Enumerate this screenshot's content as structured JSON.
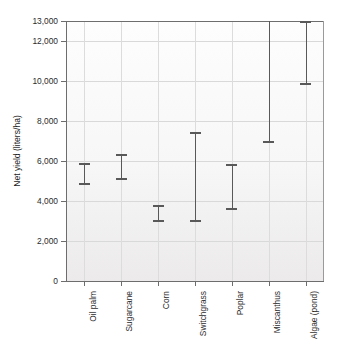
{
  "chart_data": {
    "type": "bar",
    "title": "",
    "subtitle": "",
    "xlabel": "",
    "ylabel": "Net yield (liters/ha)",
    "categories": [
      "Oil palm",
      "Sugarcane",
      "Corn",
      "Switchgrass",
      "Poplar",
      "Miscanthus",
      "Algae (pond)"
    ],
    "series": [
      {
        "name": "Net yield range",
        "low": [
          4900,
          5150,
          3050,
          3050,
          3650,
          7000,
          9900
        ],
        "high": [
          5900,
          6350,
          3800,
          7450,
          5850,
          13000,
          13000
        ]
      }
    ],
    "values": [
      5400,
      5750,
      3425,
      5250,
      4750,
      10000,
      11450
    ],
    "ranges": [
      {
        "category": "Oil palm",
        "low": 4900,
        "high": 5900,
        "clipped_high": false
      },
      {
        "category": "Sugarcane",
        "low": 5150,
        "high": 6350,
        "clipped_high": false
      },
      {
        "category": "Corn",
        "low": 3050,
        "high": 3800,
        "clipped_high": false
      },
      {
        "category": "Switchgrass",
        "low": 3050,
        "high": 7450,
        "clipped_high": false
      },
      {
        "category": "Poplar",
        "low": 3650,
        "high": 5850,
        "clipped_high": false
      },
      {
        "category": "Miscanthus",
        "low": 7000,
        "high": 13000,
        "clipped_high": true
      },
      {
        "category": "Algae (pond)",
        "low": 9900,
        "high": 13000,
        "clipped_high": false
      }
    ],
    "ylim": [
      0,
      13000
    ],
    "yticks": [
      0,
      2000,
      4000,
      6000,
      8000,
      10000,
      12000,
      13000
    ],
    "ytick_labels": [
      "0",
      "2,000",
      "4,000",
      "6,000",
      "8,000",
      "10,000",
      "12,000",
      "13,000"
    ],
    "grid": true,
    "legend": null,
    "legend_position": "none",
    "bar_color": "#595959",
    "plot_background": "#f5f4f3",
    "axis_color": "#6d6d6d",
    "grid_color": "#d9d9d9"
  }
}
